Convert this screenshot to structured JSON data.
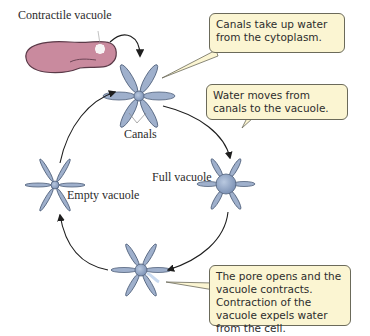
{
  "labels": {
    "contractile_vacuole": "Contractile vacuole",
    "canals": "Canals",
    "full_vacuole": "Full vacuole",
    "empty_vacuole": "Empty vacuole"
  },
  "callouts": [
    {
      "text": "Canals take up water from the cytoplasm."
    },
    {
      "text": "Water moves from canals to the vacuole."
    },
    {
      "text": "The pore opens and the vacuole contracts. Contraction of the vacuole expels water from the cell."
    }
  ],
  "colors": {
    "callout_fill": "#fbf5d2",
    "vacuole_blue": "#9fb0cc",
    "cell_pink": "#c98a9e",
    "arrow": "#2a2a2a"
  }
}
